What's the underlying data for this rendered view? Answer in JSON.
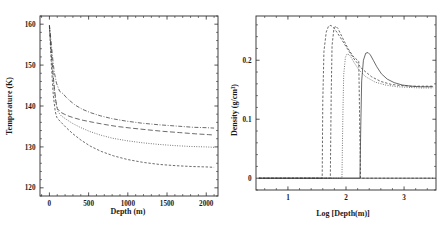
{
  "figure": {
    "background": "#ffffff",
    "ink_color": "#2b2b2b",
    "panel_count": 2
  },
  "chart_data": [
    {
      "type": "line",
      "panel": "left",
      "title": "",
      "xlabel": "Depth (m)",
      "ylabel": "Temperature (K)",
      "xlim": [
        -120,
        2150
      ],
      "ylim": [
        118,
        162
      ],
      "xticks": [
        0,
        500,
        1000,
        1500,
        2000
      ],
      "xticklabels": [
        "0",
        "500",
        "1000",
        "1500",
        "2000"
      ],
      "yticks": [
        120,
        130,
        140,
        150,
        160
      ],
      "yticklabels": [
        "120",
        "130",
        "140",
        "150",
        "160"
      ],
      "xminor_count": 5,
      "yminor_count": 5,
      "grid": false,
      "legend": "none",
      "series": [
        {
          "name": "profile-1",
          "style": "dash-dot",
          "x": [
            0,
            20,
            40,
            60,
            90,
            130,
            175,
            185,
            200,
            260,
            330,
            420,
            520,
            650,
            800,
            980,
            1180,
            1400,
            1620,
            1830,
            2000,
            2100
          ],
          "y": [
            159.8,
            156.0,
            152.0,
            148.5,
            145.6,
            143.6,
            143.0,
            142.8,
            142.4,
            141.3,
            140.2,
            139.2,
            138.4,
            137.6,
            136.9,
            136.3,
            135.8,
            135.4,
            135.1,
            134.8,
            134.7,
            134.6
          ]
        },
        {
          "name": "profile-2",
          "style": "long-dash",
          "x": [
            0,
            25,
            55,
            80,
            100,
            140,
            190,
            250,
            330,
            430,
            560,
            700,
            860,
            1040,
            1240,
            1450,
            1660,
            1860,
            2030,
            2100
          ],
          "y": [
            159.6,
            153.0,
            146.0,
            141.5,
            139.4,
            138.5,
            138.0,
            137.5,
            137.0,
            136.5,
            136.0,
            135.5,
            135.0,
            134.6,
            134.2,
            133.8,
            133.5,
            133.2,
            133.0,
            132.9
          ]
        },
        {
          "name": "profile-3",
          "style": "dotted",
          "x": [
            0,
            30,
            60,
            85,
            110,
            150,
            210,
            290,
            390,
            510,
            650,
            810,
            990,
            1190,
            1400,
            1610,
            1810,
            2000,
            2100
          ],
          "y": [
            159.7,
            151.0,
            144.0,
            140.5,
            138.6,
            137.6,
            136.8,
            135.8,
            134.8,
            133.8,
            132.9,
            132.1,
            131.5,
            131.0,
            130.6,
            130.3,
            130.1,
            130.0,
            129.9
          ]
        },
        {
          "name": "profile-4",
          "style": "short-dash",
          "x": [
            0,
            25,
            50,
            75,
            95,
            120,
            160,
            220,
            300,
            400,
            520,
            660,
            820,
            1000,
            1200,
            1410,
            1620,
            1830,
            2010,
            2100
          ],
          "y": [
            159.5,
            150.0,
            142.5,
            138.6,
            137.2,
            136.6,
            135.8,
            134.6,
            133.2,
            131.7,
            130.2,
            128.9,
            127.8,
            126.9,
            126.2,
            125.7,
            125.4,
            125.2,
            125.1,
            125.0
          ]
        }
      ]
    },
    {
      "type": "line",
      "panel": "right",
      "title": "",
      "xlabel": "Log [Depth(m)]",
      "ylabel": "Density (g/cm³)",
      "xlim": [
        0.45,
        3.55
      ],
      "ylim": [
        -0.02,
        0.275
      ],
      "xticks": [
        1,
        2,
        3
      ],
      "xticklabels": [
        "1",
        "2",
        "3"
      ],
      "yticks": [
        0,
        0.1,
        0.2
      ],
      "yticklabels": [
        "0",
        "0.1",
        "0.2"
      ],
      "xminor_count": 5,
      "yminor_count": 5,
      "grid": false,
      "legend": "none",
      "series": [
        {
          "name": "density-1",
          "style": "short-dash",
          "x": [
            0.5,
            1.59,
            1.6,
            1.62,
            1.66,
            1.7,
            1.74,
            1.78,
            1.84,
            1.92,
            2.02,
            2.14,
            2.28,
            2.44,
            2.6,
            2.78,
            2.95,
            3.12,
            3.3,
            3.5
          ],
          "y": [
            0.0,
            0.0,
            0.13,
            0.215,
            0.248,
            0.258,
            0.259,
            0.256,
            0.248,
            0.236,
            0.22,
            0.202,
            0.185,
            0.172,
            0.164,
            0.159,
            0.157,
            0.156,
            0.156,
            0.156
          ]
        },
        {
          "name": "density-2",
          "style": "dashed",
          "x": [
            0.5,
            1.73,
            1.745,
            1.76,
            1.79,
            1.82,
            1.86,
            1.91,
            1.97,
            2.04,
            2.12,
            2.22,
            2.22,
            2.25,
            2.25,
            2.35,
            2.5,
            2.68,
            2.88,
            3.08,
            3.28,
            3.5
          ],
          "y": [
            0.0,
            0.0,
            0.14,
            0.225,
            0.252,
            0.258,
            0.254,
            0.244,
            0.232,
            0.219,
            0.207,
            0.198,
            0.198,
            0.0,
            0.0,
            0.0,
            0.0,
            0.0,
            0.0,
            0.0,
            0.0,
            0.0
          ]
        },
        {
          "name": "density-3",
          "style": "dotted",
          "x": [
            0.5,
            1.93,
            1.945,
            1.96,
            1.99,
            2.02,
            2.06,
            2.1,
            2.1,
            2.14,
            2.22,
            2.34,
            2.5,
            2.68,
            2.88,
            3.08,
            3.28,
            3.5
          ],
          "y": [
            0.0,
            0.0,
            0.1,
            0.175,
            0.205,
            0.211,
            0.209,
            0.203,
            0.203,
            0.196,
            0.184,
            0.172,
            0.163,
            0.158,
            0.155,
            0.154,
            0.153,
            0.153
          ]
        },
        {
          "name": "density-4",
          "style": "solid",
          "x": [
            0.5,
            2.24,
            2.255,
            2.27,
            2.3,
            2.34,
            2.38,
            2.42,
            2.47,
            2.53,
            2.61,
            2.71,
            2.83,
            2.97,
            3.12,
            3.28,
            3.42,
            3.5
          ],
          "y": [
            0.0,
            0.0,
            0.09,
            0.165,
            0.2,
            0.212,
            0.213,
            0.209,
            0.2,
            0.189,
            0.177,
            0.168,
            0.162,
            0.158,
            0.156,
            0.155,
            0.155,
            0.155
          ]
        },
        {
          "name": "baseline-zero",
          "style": "solid",
          "x": [
            0.5,
            3.5
          ],
          "y": [
            0.0,
            0.0
          ]
        }
      ]
    }
  ]
}
